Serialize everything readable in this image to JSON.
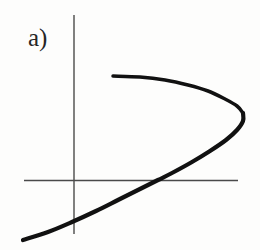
{
  "figure": {
    "panel_label": "a)",
    "background_color": "#fdfdfc",
    "axis_color": "#4a4a4a",
    "curve_color": "#111111",
    "label_color": "#262626"
  },
  "chart_data": {
    "type": "line",
    "title": "a)",
    "subtitle": "",
    "xlabel": "",
    "ylabel": "",
    "grid": false,
    "legend": "none",
    "axes": {
      "style": "crossed-axes-no-ticks",
      "origin_px": [
        74,
        180
      ],
      "x_axis_px": {
        "y": 180,
        "x_start": 24,
        "x_end": 238
      },
      "y_axis_px": {
        "x": 74,
        "y_start": 15,
        "y_end": 234
      },
      "tick_labels_x": [],
      "tick_labels_y": []
    },
    "annotations": [
      {
        "text": "a)",
        "x_px": 28,
        "y_px": 25
      }
    ],
    "series": [
      {
        "name": "sideways-parabola",
        "description": "Leftward-opening parabolic curve; upper branch begins at upper-left, bends right to a vertex at the right, then descends left crossing both axes to the lower-left corner.",
        "points_px": [
          [
            113,
            76
          ],
          [
            140,
            77
          ],
          [
            165,
            80
          ],
          [
            188,
            85
          ],
          [
            208,
            91
          ],
          [
            225,
            99
          ],
          [
            237,
            106
          ],
          [
            243,
            113
          ],
          [
            243,
            121
          ],
          [
            237,
            130
          ],
          [
            226,
            140
          ],
          [
            210,
            151
          ],
          [
            192,
            162
          ],
          [
            172,
            173
          ],
          [
            158,
            180
          ],
          [
            140,
            189
          ],
          [
            118,
            200
          ],
          [
            96,
            211
          ],
          [
            72,
            222
          ],
          [
            48,
            232
          ],
          [
            23,
            240
          ]
        ],
        "vertex_px": [
          244,
          117
        ],
        "x_axis_crossing_px": [
          158,
          180
        ],
        "y_axis_crossing_px": [
          74,
          221
        ],
        "stroke_width_px": 4
      }
    ]
  }
}
